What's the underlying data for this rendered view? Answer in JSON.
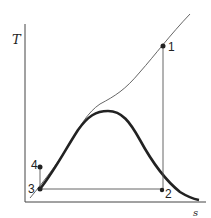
{
  "diagram": {
    "type": "T-s diagram",
    "axes": {
      "y_label": "T",
      "x_label": "s"
    },
    "points": [
      {
        "id": "1",
        "label": "1"
      },
      {
        "id": "2",
        "label": "2"
      },
      {
        "id": "3",
        "label": "3"
      },
      {
        "id": "4",
        "label": "4"
      }
    ],
    "colors": {
      "line": "#333333",
      "background": "#ffffff"
    }
  }
}
